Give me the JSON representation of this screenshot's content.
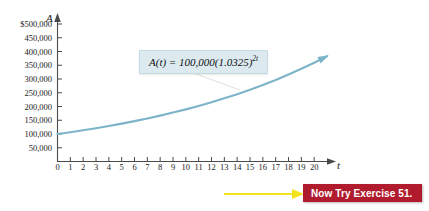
{
  "figure": {
    "background_color": "#ffffff"
  },
  "chart_data": {
    "type": "line",
    "title": "",
    "xlabel": "t",
    "ylabel": "A",
    "xlim": [
      0,
      21
    ],
    "ylim": [
      0,
      500000
    ],
    "grid": false,
    "legend": "none",
    "annotation": "A(t) = 100,000(1.0325)^(2t)",
    "x_ticks": [
      0,
      1,
      2,
      3,
      4,
      5,
      6,
      7,
      8,
      9,
      10,
      11,
      12,
      13,
      14,
      15,
      16,
      17,
      18,
      19,
      20
    ],
    "x_tick_labels": [
      "0",
      "1",
      "2",
      "3",
      "4",
      "5",
      "6",
      "7",
      "8",
      "9",
      "10",
      "11",
      "12",
      "13",
      "14",
      "15",
      "16",
      "17",
      "18",
      "19",
      "20"
    ],
    "y_ticks": [
      500000,
      450000,
      400000,
      350000,
      300000,
      250000,
      200000,
      150000,
      100000,
      50000
    ],
    "y_tick_labels": [
      "$500,000",
      "450,000",
      "400,000",
      "350,000",
      "300,000",
      "250,000",
      "200,000",
      "150,000",
      "100,000",
      "50,000"
    ],
    "series": [
      {
        "name": "A(t) = 100,000(1.0325)^(2t)",
        "color": "#7db4c9",
        "x": [
          0,
          1,
          2,
          3,
          4,
          5,
          6,
          7,
          8,
          9,
          10,
          11,
          12,
          13,
          14,
          15,
          16,
          17,
          18,
          19,
          20,
          21
        ],
        "values": [
          100000,
          106606,
          113648,
          121153,
          129154,
          137685,
          146779,
          156475,
          166812,
          177833,
          189584,
          202111,
          215464,
          229697,
          244868,
          261036,
          278267,
          296629,
          316195,
          337048,
          359268,
          382949
        ]
      }
    ]
  },
  "axes": {
    "y_variable": "A",
    "x_variable": "t"
  },
  "formula": {
    "function_name": "A",
    "argument": "t",
    "equals": "=",
    "coefficient": "100,000",
    "base": "(1.0325)",
    "exponent": "2t",
    "full_text": "A(t) = 100,000(1.0325)"
  },
  "callout": {
    "label": "Now Try Exercise 51.",
    "banner_color": "#b01c2e",
    "text_color": "#ffffff",
    "arrow_color": "#f2e31c"
  },
  "colors": {
    "curve": "#7db4c9",
    "axis": "#4a4a4a",
    "formula_box_background": "#dceaf0",
    "formula_box_border": "#c3dbe4"
  }
}
